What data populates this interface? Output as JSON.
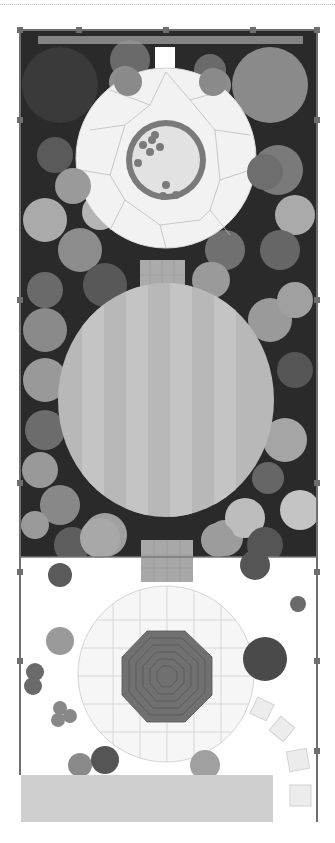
{
  "plan": {
    "type": "garden-landscape-plan",
    "colors": {
      "bed_dark": "#2a2a2a",
      "fence": "#6e6e6e",
      "patio_light": "#f2f2f2",
      "patio_lines": "#b5b5b5",
      "lawn": "#b8b8b8",
      "lawn_stripe": "#c4c4c4",
      "pond_ring": "#7a7a7a",
      "pond_water": "#dedede",
      "octagon_deck": "#707070",
      "path": "#a8a8a8",
      "gravel_strip": "#cfcfcf"
    },
    "areas": [
      {
        "name": "upper-patio-circle"
      },
      {
        "name": "pond"
      },
      {
        "name": "brick-path-1"
      },
      {
        "name": "oval-lawn"
      },
      {
        "name": "brick-path-2"
      },
      {
        "name": "lower-paved-circle"
      },
      {
        "name": "octagonal-deck"
      },
      {
        "name": "stepping-stones"
      },
      {
        "name": "gravel-strip"
      }
    ]
  }
}
